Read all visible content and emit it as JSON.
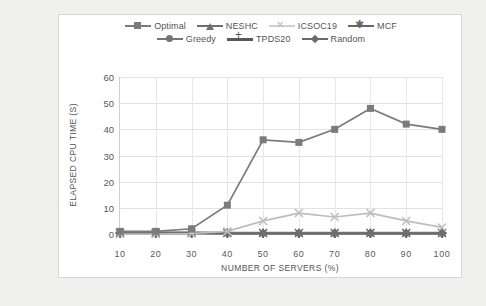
{
  "chart_data": {
    "type": "line",
    "title": "",
    "xlabel": "NUMBER OF SERVERS (%)",
    "ylabel": "ELAPSED CPU TIME (S)",
    "categories": [
      "10",
      "20",
      "30",
      "40",
      "50",
      "60",
      "70",
      "80",
      "90",
      "100"
    ],
    "x": [
      10,
      20,
      30,
      40,
      50,
      60,
      70,
      80,
      90,
      100
    ],
    "xlim": [
      10,
      100
    ],
    "ylim": [
      0,
      60
    ],
    "yticks": [
      0,
      10,
      20,
      30,
      40,
      50,
      60
    ],
    "grid": "horizontal-and-vertical",
    "legend_position": "top",
    "series": [
      {
        "name": "Optimal",
        "marker": "square",
        "color": "#7b7b7b",
        "values": [
          1,
          1,
          2,
          11,
          36,
          35,
          40,
          48,
          42,
          40
        ]
      },
      {
        "name": "NESHC",
        "marker": "triangle",
        "color": "#6f6f6f",
        "values": [
          0.6,
          0.6,
          0.6,
          0.5,
          0.5,
          0.5,
          0.5,
          0.5,
          0.5,
          0.5
        ]
      },
      {
        "name": "ICSOC19",
        "marker": "x",
        "color": "#bdbdbd",
        "values": [
          0,
          0,
          0.2,
          1,
          5,
          8,
          6.5,
          8,
          5,
          2.5
        ]
      },
      {
        "name": "MCF",
        "marker": "star",
        "color": "#676767",
        "values": [
          0.5,
          0.5,
          0.5,
          0.4,
          0.4,
          0.4,
          0.4,
          0.4,
          0.4,
          0.4
        ]
      },
      {
        "name": "Greedy",
        "marker": "circle",
        "color": "#757575",
        "values": [
          0.4,
          0.4,
          0.4,
          0.3,
          0.3,
          0.3,
          0.3,
          0.3,
          0.3,
          0.3
        ]
      },
      {
        "name": "TPDS20",
        "marker": "plus",
        "color": "#595959",
        "values": [
          0.3,
          0.3,
          0.3,
          0.2,
          0.2,
          0.2,
          0.2,
          0.2,
          0.2,
          0.2
        ]
      },
      {
        "name": "Random",
        "marker": "diamond",
        "color": "#6b6b6b",
        "values": [
          0.2,
          0.2,
          0.2,
          0.15,
          0.15,
          0.15,
          0.15,
          0.15,
          0.15,
          0.15
        ]
      }
    ]
  },
  "colors": {
    "page_background": "#f0f0ef",
    "card_background": "#ffffff",
    "card_border": "#d7d7d7",
    "gridline": "#e2e2e2",
    "axis": "#9a9a9a",
    "tick_text": "#595959",
    "label_text": "#555555"
  }
}
